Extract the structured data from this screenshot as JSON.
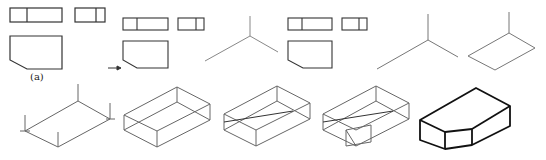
{
  "figure": {
    "label": "(a)",
    "arrow": "→",
    "steps": [
      {
        "id": "step-1",
        "description": "Three orthographic views (front, side, top)"
      },
      {
        "id": "step-2",
        "description": "Views with isometric axes"
      },
      {
        "id": "step-3",
        "description": "Views with isometric axes and bottom face"
      },
      {
        "id": "step-4",
        "description": "Base rectangle with vertical edges"
      },
      {
        "id": "step-5",
        "description": "Full bounding box"
      },
      {
        "id": "step-6",
        "description": "Bounding box with center line"
      },
      {
        "id": "step-7",
        "description": "Bounding box with chamfer cut"
      },
      {
        "id": "step-8",
        "description": "Final isometric solid"
      }
    ]
  },
  "colors": {
    "line": "#333333",
    "thin": "#777777",
    "bold": "#111111"
  }
}
